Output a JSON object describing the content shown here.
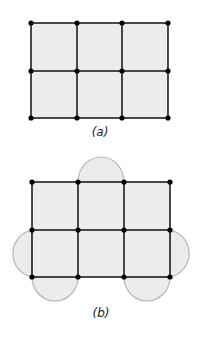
{
  "figures": [
    {
      "label": "(a)",
      "grid": {
        "cols": 3,
        "rows": 2,
        "x": [
          31,
          77,
          122,
          168
        ],
        "y": [
          23,
          71,
          118
        ]
      },
      "semicircles": []
    },
    {
      "label": "(b)",
      "grid": {
        "cols": 3,
        "rows": 2,
        "x": [
          32,
          78,
          124,
          170
        ],
        "y": [
          182,
          230,
          277
        ]
      },
      "semicircles": [
        "top of middle top cell",
        "left of bottom-left cell",
        "right of bottom-right cell",
        "below bottom-left cell",
        "below bottom-right cell"
      ]
    }
  ],
  "colors": {
    "fill": "#ececec",
    "edge": "#111111",
    "arc": "#b5b5b5",
    "node": "#000000"
  }
}
